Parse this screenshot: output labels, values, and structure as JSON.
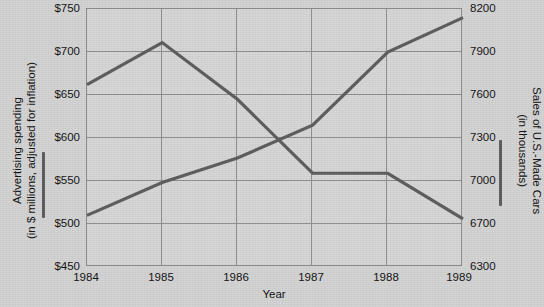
{
  "chart_data": {
    "type": "line",
    "title": "",
    "xlabel": "Year",
    "categories": [
      "1984",
      "1985",
      "1986",
      "1987",
      "1988",
      "1989"
    ],
    "x": [
      1984,
      1985,
      1986,
      1987,
      1988,
      1989
    ],
    "grid": true,
    "legend_position": "axis-labels",
    "series": [
      {
        "name": "Advertising spending (in $ millions, adjusted for inflation)",
        "axis": "left",
        "color": "#5b5b5b",
        "values": [
          662,
          711,
          645,
          559,
          559,
          506
        ]
      },
      {
        "name": "Sales of U.S.-Made Cars (in thousands)",
        "axis": "right",
        "color": "#5b5b5b",
        "values": [
          6760,
          6990,
          7160,
          7390,
          7900,
          8140
        ]
      }
    ],
    "left_axis": {
      "label_line1": "Advertising spending",
      "label_line2": "(in $ millions, adjusted for inflation)",
      "ticks": [
        "$750",
        "$700",
        "$650",
        "$600",
        "$550",
        "$500",
        "$450"
      ],
      "tick_values": [
        750,
        700,
        650,
        600,
        550,
        500,
        450
      ],
      "ylim": [
        450,
        750
      ]
    },
    "right_axis": {
      "label_line1": "Sales of U.S.-Made Cars",
      "label_line2": "(in thousands)",
      "ticks": [
        "8200",
        "7900",
        "7600",
        "7300",
        "7000",
        "6700",
        "6300"
      ],
      "tick_values": [
        8200,
        7900,
        7600,
        7300,
        7000,
        6700,
        6300
      ],
      "ylim": [
        6300,
        8200
      ]
    },
    "colors": {
      "background": "#d2d2d2",
      "plot_background": "#d5d5d5",
      "grid": "#8d8d8d",
      "axis_border": "#8a8a8a",
      "series_line": "#5b5b5b",
      "text": "#111111"
    }
  }
}
